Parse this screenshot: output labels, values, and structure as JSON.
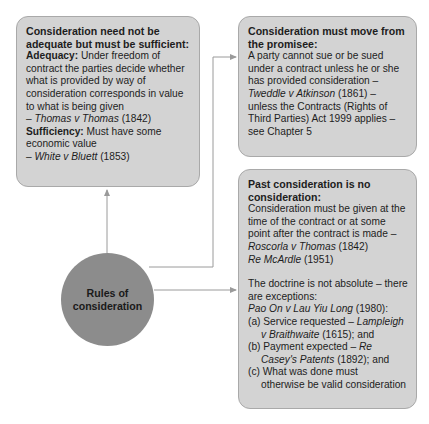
{
  "hub": {
    "label_line1": "Rules of",
    "label_line2": "consideration"
  },
  "box1": {
    "title_line1": "Consideration need not be",
    "title_line2": "adequate but must be sufficient:",
    "adequacy_label": "Adequacy:",
    "adequacy_line1": " Under freedom of",
    "adequacy_line2": "contract the parties decide whether",
    "adequacy_line3": "what is provided by way of",
    "adequacy_line4": "consideration corresponds in value",
    "adequacy_line5": "to what is being given",
    "adequacy_case_dash": "– ",
    "adequacy_case": "Thomas v Thomas",
    "adequacy_case_year": " (1842)",
    "sufficiency_label": "Sufficiency:",
    "sufficiency_line1": " Must have some",
    "sufficiency_line2": "economic value",
    "sufficiency_case_dash": "– ",
    "sufficiency_case": "White v Bluett",
    "sufficiency_case_year": " (1853)"
  },
  "box2": {
    "title_line1": "Consideration must move from",
    "title_line2": "the promisee:",
    "line1": "A party cannot sue or be sued",
    "line2": "under a contract unless he or she",
    "line3": "has provided consideration –",
    "case": "Tweddle v Atkinson",
    "case_year": " (1861) –",
    "line5": "unless the Contracts (Rights of",
    "line6": "Third Parties) Act 1999 applies –",
    "line7": "see Chapter 5"
  },
  "box3": {
    "title_line1": "Past consideration is no",
    "title_line2": "consideration:",
    "line1": "Consideration must be given at the",
    "line2": "time of the contract or at some",
    "line3": "point after the contract is made –",
    "case1": "Roscorla v Thomas",
    "case1_year": " (1842)",
    "case2": "Re McArdle",
    "case2_year": " (1951)",
    "para2_line1": "The doctrine is not absolute – there",
    "para2_line2": "are exceptions:",
    "case3": "Pao On v Lau Yiu Long",
    "case3_year": " (1980):",
    "a_text": "(a) Service requested – ",
    "a_case1": "Lampleigh",
    "a_case2": "v Braithwaite",
    "a_tail": " (1615); and",
    "b_text": "(b) Payment expected – ",
    "b_case1": "Re",
    "b_case2": "Casey's Patents",
    "b_tail": " (1892); and",
    "c_line1": "(c) What was done must",
    "c_line2": "otherwise be valid consideration"
  },
  "colors": {
    "box_fill": "#d3d3d3",
    "box_border": "#a9a9a9",
    "hub_fill": "#8c8c8c",
    "connector": "#9a9a9a"
  }
}
